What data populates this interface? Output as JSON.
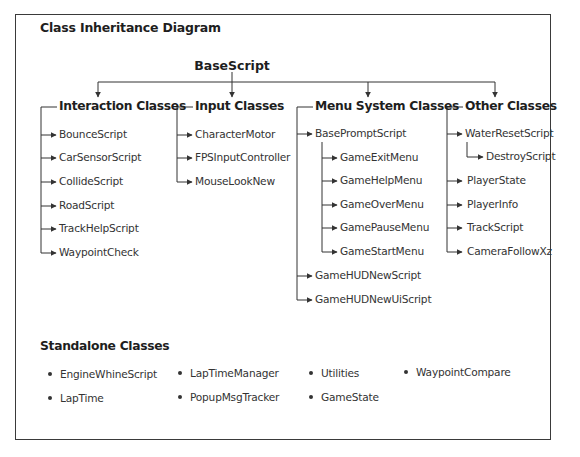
{
  "diagram": {
    "title": "Class Inheritance Diagram",
    "root": "BaseScript",
    "groups": [
      {
        "header": "Interaction Classes",
        "children": [
          "BounceScript",
          "CarSensorScript",
          "CollideScript",
          "RoadScript",
          "TrackHelpScript",
          "WaypointCheck"
        ]
      },
      {
        "header": "Input Classes",
        "children": [
          "CharacterMotor",
          "FPSInputController",
          "MouseLookNew"
        ]
      },
      {
        "header": "Menu System Classes",
        "children": [
          {
            "name": "BasePromptScript",
            "children": [
              "GameExitMenu",
              "GameHelpMenu",
              "GameOverMenu",
              "GamePauseMenu",
              "GameStartMenu"
            ]
          },
          {
            "name": "GameHUDNewScript"
          },
          {
            "name": "GameHUDNewUiScript"
          }
        ]
      },
      {
        "header": "Other Classes",
        "children": [
          {
            "name": "WaterResetScript",
            "children": [
              "DestroyScript"
            ]
          },
          {
            "name": "PlayerState"
          },
          {
            "name": "PlayerInfo"
          },
          {
            "name": "TrackScript"
          },
          {
            "name": "CameraFollowXz"
          }
        ]
      }
    ],
    "standalone": {
      "title": "Standalone Classes",
      "columns": [
        [
          "EngineWhineScript",
          "LapTime"
        ],
        [
          "LapTimeManager",
          "PopupMsgTracker"
        ],
        [
          "Utilities",
          "GameState"
        ],
        [
          "WaypointCompare"
        ]
      ]
    }
  },
  "colors": {
    "line": "#333333",
    "text": "#333333",
    "frame": "#3a3a3a"
  }
}
